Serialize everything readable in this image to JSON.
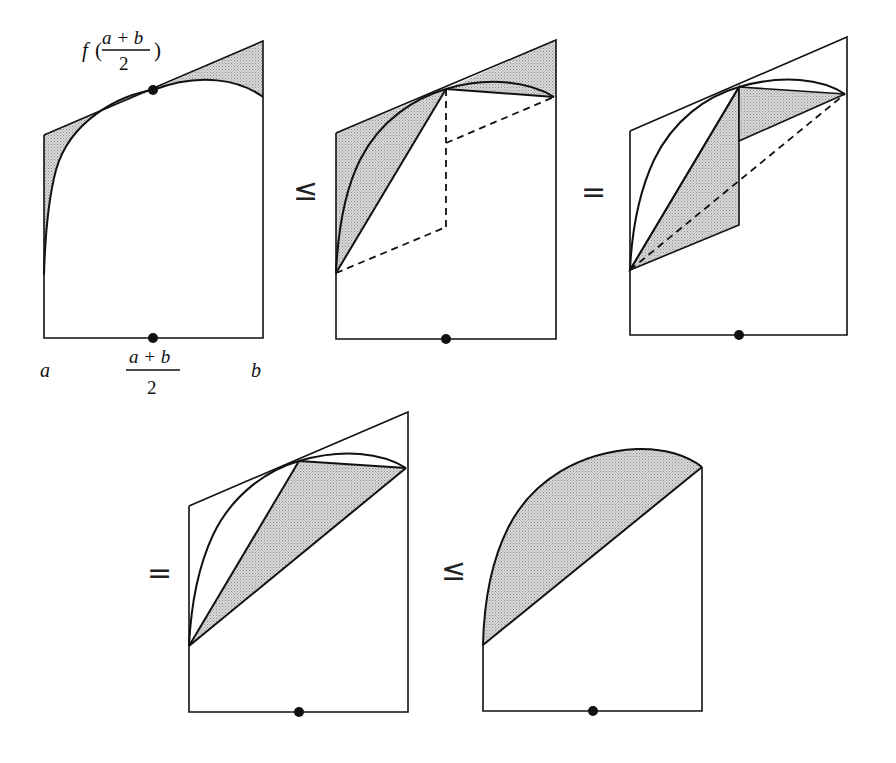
{
  "figure": {
    "colors": {
      "stroke": "#111111",
      "shade": "#c4c4c4",
      "background": "#ffffff"
    },
    "labels": {
      "f_prefix": "f",
      "open_paren": "(",
      "close_paren": ")",
      "numerator": "a + b",
      "denominator": "2",
      "a": "a",
      "b": "b",
      "mid_numerator": "a + b",
      "mid_denominator": "2"
    },
    "relations": {
      "rel1": "≤",
      "rel2": "=",
      "rel3": "=",
      "rel4": "≤"
    },
    "panels": [
      {
        "id": 1,
        "caption": "Tangent trapezoid at midpoint minus area under curve (shaded gaps)"
      },
      {
        "id": 2,
        "caption": "Shaded region with dashed midpoint-split trapezoids"
      },
      {
        "id": 3,
        "caption": "Rearranged shaded quadrilaterals with dashed chord"
      },
      {
        "id": 4,
        "caption": "Shaded triangle between chords"
      },
      {
        "id": 5,
        "caption": "Shaded region between curve and chord"
      }
    ]
  }
}
